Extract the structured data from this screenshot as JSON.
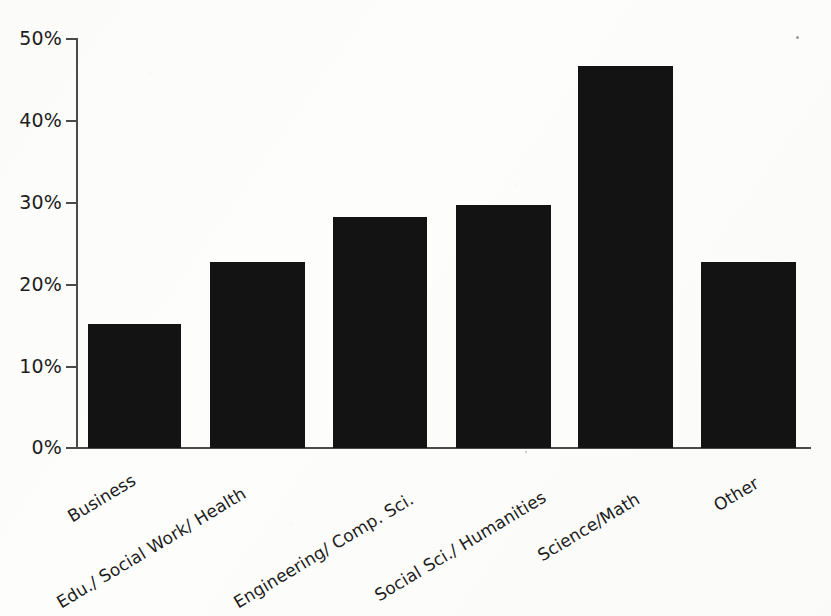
{
  "chart_data": {
    "type": "bar",
    "title": "",
    "subtitle": "",
    "xlabel": "",
    "ylabel": "",
    "categories": [
      "Business",
      "Edu./ Social Work/ Health",
      "Engineering/ Comp. Sci.",
      "Social Sci./ Humanities",
      "Science/Math",
      "Other"
    ],
    "values": [
      15.2,
      22.7,
      28.3,
      29.7,
      46.7,
      22.7
    ],
    "ylim": [
      0,
      50
    ],
    "yticks": [
      0,
      10,
      20,
      30,
      40,
      50
    ],
    "ytick_labels": [
      "0%",
      "10%",
      "20%",
      "30%",
      "40%",
      "50%"
    ],
    "grid": false,
    "legend": null,
    "legend_position": "none",
    "bar_color": "#131313",
    "axis_color": "#4a4a4a",
    "background_color": "#fdfdfb",
    "label_rotation_degrees": -31
  },
  "axis": {
    "y_ticks": [
      {
        "label": "50%",
        "value": 50
      },
      {
        "label": "40%",
        "value": 40
      },
      {
        "label": "30%",
        "value": 30
      },
      {
        "label": "20%",
        "value": 20
      },
      {
        "label": "10%",
        "value": 10
      },
      {
        "label": "0%",
        "value": 0
      }
    ]
  },
  "bars": [
    {
      "label": "Business",
      "value": 15.2
    },
    {
      "label": "Edu./ Social Work/ Health",
      "value": 22.7
    },
    {
      "label": "Engineering/ Comp. Sci.",
      "value": 28.3
    },
    {
      "label": "Social Sci./ Humanities",
      "value": 29.7
    },
    {
      "label": "Science/Math",
      "value": 46.7
    },
    {
      "label": "Other",
      "value": 22.7
    }
  ]
}
